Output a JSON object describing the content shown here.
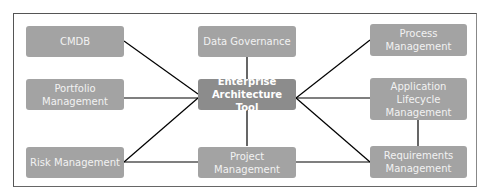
{
  "diagram": {
    "center": {
      "id": "eat",
      "label_lines": [
        "Enterprise",
        "Architecture Tool"
      ]
    },
    "nodes": [
      {
        "id": "cmdb",
        "label_lines": [
          "CMDB"
        ]
      },
      {
        "id": "data-governance",
        "label_lines": [
          "Data Governance"
        ]
      },
      {
        "id": "process-management",
        "label_lines": [
          "Process",
          "Management"
        ]
      },
      {
        "id": "portfolio-management",
        "label_lines": [
          "Portfolio",
          "Management"
        ]
      },
      {
        "id": "application-lifecycle-management",
        "label_lines": [
          "Application",
          "Lifecycle",
          "Management"
        ]
      },
      {
        "id": "risk-management",
        "label_lines": [
          "Risk Management"
        ]
      },
      {
        "id": "project-management",
        "label_lines": [
          "Project",
          "Management"
        ]
      },
      {
        "id": "requirements-management",
        "label_lines": [
          "Requirements",
          "Management"
        ]
      }
    ],
    "edges": [
      [
        "cmdb",
        "eat"
      ],
      [
        "data-governance",
        "eat"
      ],
      [
        "process-management",
        "eat"
      ],
      [
        "portfolio-management",
        "eat"
      ],
      [
        "application-lifecycle-management",
        "eat"
      ],
      [
        "risk-management",
        "eat"
      ],
      [
        "project-management",
        "eat"
      ],
      [
        "requirements-management",
        "eat"
      ],
      [
        "risk-management",
        "project-management"
      ],
      [
        "project-management",
        "requirements-management"
      ],
      [
        "application-lifecycle-management",
        "requirements-management"
      ]
    ],
    "colors": {
      "node": "#a3a3a3",
      "center": "#8c8c8c",
      "line": "#000000",
      "text": "#f2f2f2"
    }
  }
}
